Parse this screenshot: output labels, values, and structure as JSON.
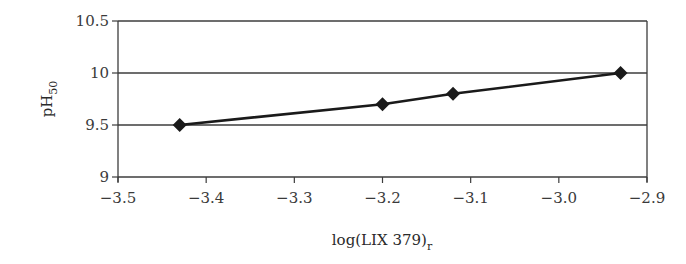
{
  "chart_data": {
    "type": "line",
    "title": "",
    "xlabel": "log(LIX 379)",
    "xlabel_subscript": "r",
    "ylabel": "pH",
    "ylabel_subscript": "50",
    "xlim": [
      -3.5,
      -2.9
    ],
    "ylim": [
      9,
      10.5
    ],
    "xticks": [
      "-3.5",
      "-3.4",
      "-3.3",
      "-3.2",
      "-3.1",
      "-3.0",
      "-2.9"
    ],
    "xtick_values": [
      -3.5,
      -3.4,
      -3.3,
      -3.2,
      -3.1,
      -3.0,
      -2.9
    ],
    "yticks": [
      "9",
      "9.5",
      "10",
      "10.5"
    ],
    "ytick_values": [
      9,
      9.5,
      10,
      10.5
    ],
    "grid": "horizontal",
    "legend": "none",
    "series": [
      {
        "name": "pH50",
        "marker": "diamond",
        "color": "#1a1a1a",
        "x": [
          -3.43,
          -3.2,
          -3.12,
          -2.93
        ],
        "y": [
          9.5,
          9.7,
          9.8,
          10.0
        ]
      }
    ]
  }
}
